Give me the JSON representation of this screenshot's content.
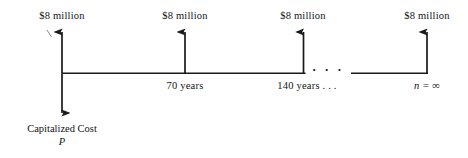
{
  "diagram": {
    "type": "cash-flow-timeline",
    "axis_color": "#1a1a1a",
    "text_color": "#141414",
    "background": "#ffffff",
    "inflow_arrows": [
      {
        "id": "arrow-0",
        "label": "$8 million",
        "x": 62,
        "label_x": 62,
        "label_y": 10
      },
      {
        "id": "arrow-70",
        "label": "$8 million",
        "x": 185,
        "label_x": 185,
        "label_y": 10
      },
      {
        "id": "arrow-140",
        "label": "$8 million",
        "x": 303,
        "label_x": 303,
        "label_y": 10
      },
      {
        "id": "arrow-inf",
        "label": "$8 million",
        "x": 427,
        "label_x": 427,
        "label_y": 10
      }
    ],
    "time_labels": [
      {
        "id": "t-70",
        "text": "70 years",
        "x": 185,
        "y": 80,
        "italic": false
      },
      {
        "id": "t-140",
        "text": "140 years . . .",
        "x": 307,
        "y": 80,
        "italic": false
      },
      {
        "id": "t-inf",
        "text": "n = ∞",
        "x": 427,
        "y": 80,
        "italic": true
      }
    ],
    "break_dots": "· · ·",
    "outflow": {
      "arrow_x": 62,
      "label_line1": "Capitalized Cost",
      "label_line2": "P"
    }
  }
}
